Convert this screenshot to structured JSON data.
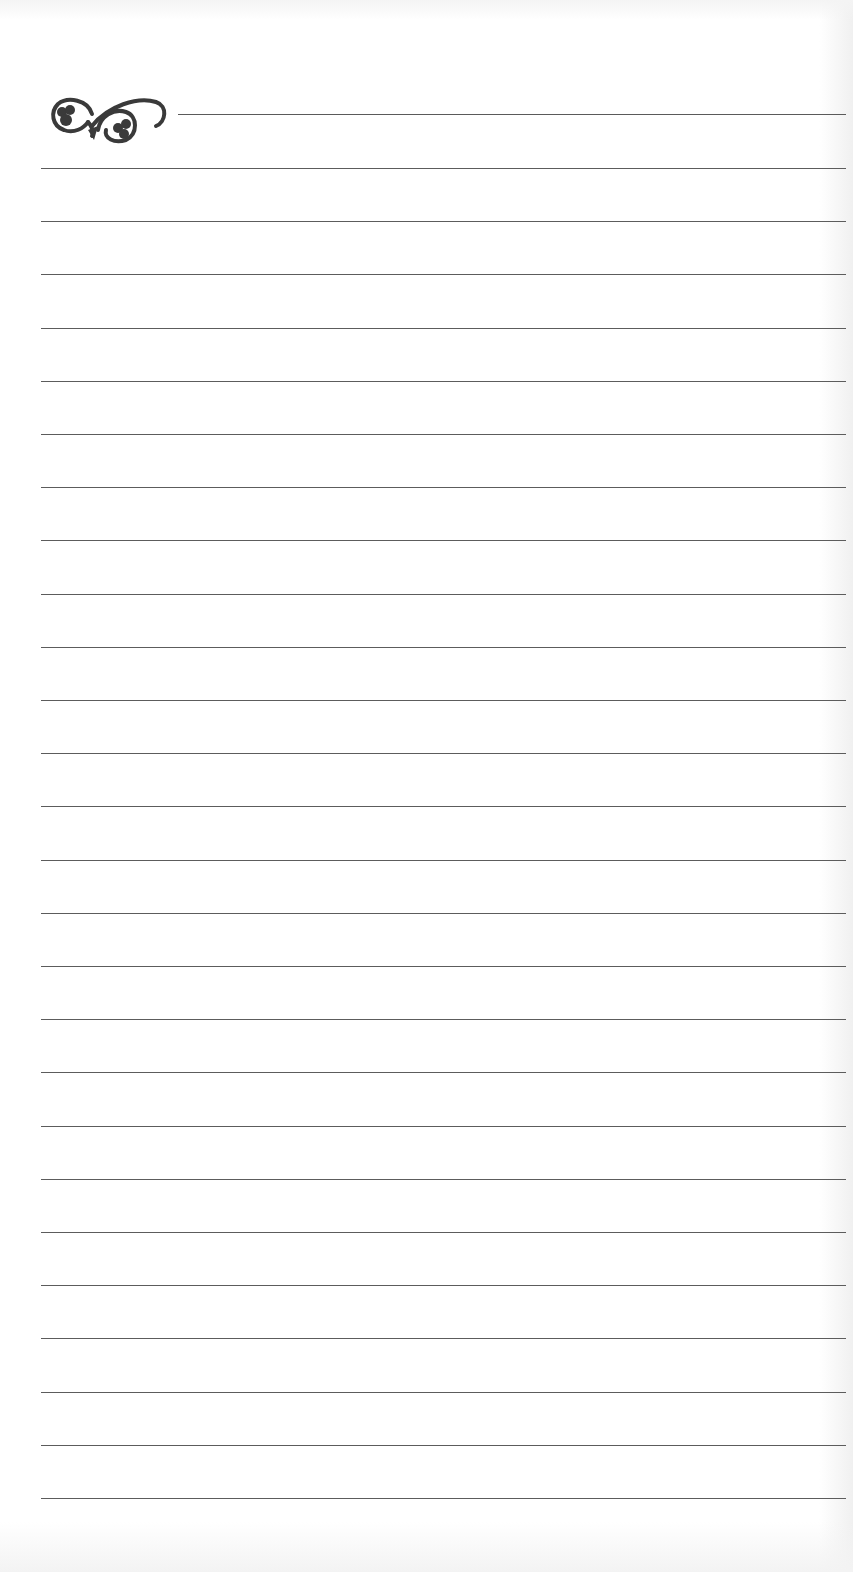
{
  "page": {
    "type": "lined-notebook-page",
    "ornament_icon": "flourish-ornament-icon",
    "line_color": "#5c5c5c",
    "ruled_line_count": 26,
    "first_line_y": 168,
    "line_spacing": 53.2
  }
}
